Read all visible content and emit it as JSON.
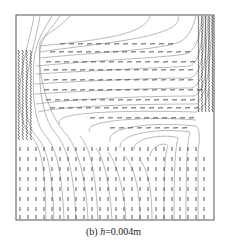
{
  "figure": {
    "panel_label": "(b)",
    "variable": "h",
    "value_text": "=0.004m",
    "frame": {
      "x": 16,
      "y": 15,
      "w": 198,
      "h": 205
    },
    "colors": {
      "frame": "#555555",
      "solid_line": "#9a9a9a",
      "dashed_line": "#444444",
      "background": "#ffffff"
    },
    "streamlines": [
      "M34 16 C30 40 22 60 20 85 C19 110 22 125 30 135 C40 145 45 160 46 220",
      "M40 16 C36 40 28 62 26 88 C25 112 28 126 36 136 C46 146 52 165 54 220",
      "M52 16 C44 30 36 40 34 60 C32 95 34 120 44 134 C56 146 62 170 64 220",
      "M60 16 C52 28 42 36 40 50 C38 95 44 120 56 134 C68 148 74 175 76 220",
      "M70 16 C58 30 44 34 40 42 C36 80 52 120 66 134 C78 148 86 178 88 220",
      "M150 16 C145 35 100 40 40 46",
      "M40 52 C90 44 160 40 176 24 C180 20 178 16 178 16",
      "M40 58 C100 52 160 50 180 42 C190 36 194 24 196 16",
      "M36 66 C100 60 160 58 186 54 C196 50 200 38 202 16",
      "M36 74 C100 70 160 68 190 66 C198 62 202 50 204 16",
      "M34 84 C100 80 160 78 190 78 C200 74 204 60 206 16",
      "M34 94 C100 90 160 88 192 88 C202 84 206 68 208 16",
      "M36 104 C80 98 160 96 194 96 C204 92 208 74 210 16",
      "M38 112 C60 106 140 104 196 104 C205 98 210 80 212 16",
      "M60 124 C50 112 120 110 196 112 C204 108 208 100 208 90",
      "M90 132 C80 120 150 116 196 120",
      "M110 142 C105 125 160 122 196 126 C200 128 200 140 198 150 L198 220",
      "M120 148 C118 132 165 128 190 132 C188 140 186 150 186 220",
      "M134 150 C132 136 170 134 178 138 C176 146 174 156 174 220",
      "M150 156 C152 144 166 142 168 146 C166 150 164 160 164 220",
      "M98 220 C96 180 92 150 80 136",
      "M112 220 C110 185 104 158 96 148",
      "M126 220 C124 188 116 162 108 152",
      "M140 220 C140 190 134 165 124 155",
      "M152 220 C152 190 148 170 140 160"
    ],
    "vector_columns_x": [
      20,
      28,
      36,
      44,
      52,
      60,
      68,
      76,
      84,
      92,
      100,
      108,
      116,
      124,
      132,
      140,
      148,
      156,
      164,
      172,
      180,
      188,
      196,
      204
    ],
    "vector_rows_y_bottom": [
      150,
      160,
      170,
      180,
      190,
      200,
      210,
      218
    ],
    "horizontal_vector_rows": [
      {
        "y": 44,
        "x_start": 60,
        "x_end": 170
      },
      {
        "y": 52,
        "x_start": 50,
        "x_end": 185
      },
      {
        "y": 62,
        "x_start": 46,
        "x_end": 190
      },
      {
        "y": 70,
        "x_start": 44,
        "x_end": 194
      },
      {
        "y": 80,
        "x_start": 44,
        "x_end": 196
      },
      {
        "y": 90,
        "x_start": 44,
        "x_end": 198
      },
      {
        "y": 100,
        "x_start": 46,
        "x_end": 198
      },
      {
        "y": 108,
        "x_start": 50,
        "x_end": 198
      },
      {
        "y": 118,
        "x_start": 90,
        "x_end": 196
      },
      {
        "y": 128,
        "x_start": 110,
        "x_end": 190
      }
    ]
  }
}
